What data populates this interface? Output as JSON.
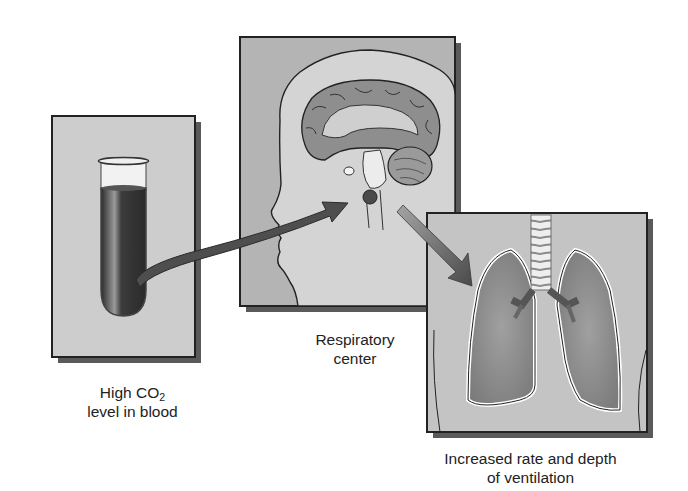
{
  "diagram": {
    "type": "flow",
    "nodes": [
      {
        "id": "blood",
        "label_line1_prefix": "High CO",
        "label_line1_sub": "2",
        "label_line2": "level in blood",
        "depicts": "test tube with dark blood"
      },
      {
        "id": "respiratory_center",
        "label_line1": "Respiratory",
        "label_line2": "center",
        "depicts": "head sagittal section with brain and brainstem, dark dot marking respiratory center"
      },
      {
        "id": "ventilation",
        "label_line1": "Increased rate and depth",
        "label_line2": "of ventilation",
        "depicts": "lungs with trachea and bronchi"
      }
    ],
    "edges": [
      {
        "from": "blood",
        "to": "respiratory_center",
        "style": "curved dark arrow"
      },
      {
        "from": "respiratory_center",
        "to": "ventilation",
        "style": "tapered gradient arrow"
      }
    ],
    "colors": {
      "panel_fill": "#c9c9c9",
      "panel_border": "#222222",
      "shadow": "#555555",
      "blood": "#3a3a3a",
      "brain": "#8a8a8a",
      "lung": "#8c8c8c",
      "arrow": "#4a4a4a"
    }
  }
}
